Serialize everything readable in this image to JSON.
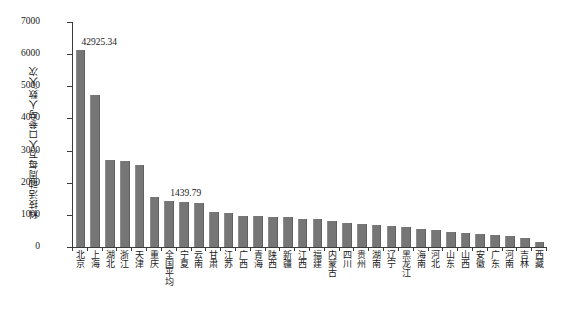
{
  "chart_data": {
    "type": "bar",
    "title": "",
    "xlabel": "",
    "ylabel": "科技活动周每万人口参与人数/人次",
    "ylim": [
      0,
      7000
    ],
    "yticks": [
      0,
      1000,
      2000,
      3000,
      4000,
      5000,
      6000,
      7000
    ],
    "grid": false,
    "legend": false,
    "bar_color": "#767676",
    "axis_color": "#3b3b3b",
    "text_color": "#1a1a1a",
    "categories": [
      "北京",
      "上海",
      "湖北",
      "浙江",
      "天津",
      "重庆",
      "全国平均",
      "宁夏",
      "云南",
      "甘肃",
      "江苏",
      "广西",
      "青海",
      "陕西",
      "新疆",
      "江西",
      "福建",
      "内蒙古",
      "四川",
      "贵州",
      "湖南",
      "辽宁",
      "黑龙江",
      "海南",
      "河北",
      "山东",
      "山西",
      "安徽",
      "广东",
      "河南",
      "吉林",
      "西藏"
    ],
    "values": [
      6120,
      4740,
      2700,
      2670,
      2560,
      1560,
      1440,
      1390,
      1360,
      1100,
      1050,
      960,
      950,
      940,
      930,
      880,
      860,
      800,
      760,
      720,
      690,
      640,
      610,
      560,
      520,
      470,
      440,
      400,
      360,
      330,
      290,
      150
    ],
    "annotations": [
      {
        "category": "北京",
        "text": "42925.34",
        "note": "真实值超出坐标轴上限，柱体被截断"
      },
      {
        "category": "全国平均",
        "text": "1439.79"
      }
    ]
  }
}
